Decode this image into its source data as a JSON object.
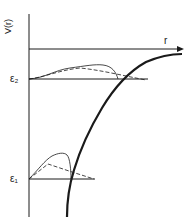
{
  "diagram": {
    "y_axis_label": "V(r)",
    "x_axis_label": "r",
    "levels": [
      {
        "name": "epsilon-2",
        "label": "ε₂"
      },
      {
        "name": "epsilon-1",
        "label": "ε₁"
      }
    ],
    "colors": {
      "line": "#1a1a1a",
      "background": "#ffffff"
    }
  }
}
